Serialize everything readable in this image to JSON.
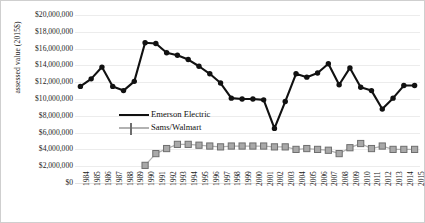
{
  "chart_data": {
    "type": "line",
    "title": "",
    "xlabel": "",
    "ylabel": "assessed value (2015$)",
    "ylim": [
      0,
      20000000
    ],
    "ytick_step": 2000000,
    "grid": true,
    "legend_position": "inside-left-center",
    "ytick_labels": [
      "$20,000,000",
      "$18,000,000",
      "$16,000,000",
      "$14,000,000",
      "$12,000,000",
      "$10,000,000",
      "$8,000,000",
      "$6,000,000",
      "$4,000,000",
      "$2,000,000",
      "$0"
    ],
    "ytick_values": [
      20000000,
      18000000,
      16000000,
      14000000,
      12000000,
      10000000,
      8000000,
      6000000,
      4000000,
      2000000,
      0
    ],
    "categories": [
      "1984",
      "1985",
      "1986",
      "1987",
      "1988",
      "1989",
      "1990",
      "1991",
      "1992",
      "1993",
      "1994",
      "1995",
      "1996",
      "1997",
      "1998",
      "1999",
      "2000",
      "2001",
      "2002",
      "2003",
      "2004",
      "2005",
      "2006",
      "2007",
      "2008",
      "2009",
      "2010",
      "2011",
      "2012",
      "2013",
      "2014",
      "2015"
    ],
    "series": [
      {
        "name": "Emerson Electric",
        "color": "#111111",
        "marker": "circle",
        "values": [
          11500000,
          12400000,
          13800000,
          11500000,
          11000000,
          12100000,
          16700000,
          16600000,
          15500000,
          15200000,
          14700000,
          13900000,
          13000000,
          11900000,
          10100000,
          10000000,
          10000000,
          9900000,
          6500000,
          9700000,
          13000000,
          12600000,
          13100000,
          14200000,
          11700000,
          13700000,
          11400000,
          11000000,
          8800000,
          10100000,
          11600000,
          11600000
        ]
      },
      {
        "name": "Sams/Walmart",
        "color": "#a8a8a8",
        "marker": "square",
        "values": [
          null,
          null,
          null,
          null,
          null,
          null,
          2100000,
          3500000,
          4100000,
          4600000,
          4600000,
          4500000,
          4400000,
          4300000,
          4400000,
          4400000,
          4400000,
          4400000,
          4300000,
          4300000,
          4000000,
          4100000,
          4000000,
          3900000,
          3500000,
          4200000,
          4700000,
          4100000,
          4400000,
          4000000,
          4000000,
          4000000
        ]
      }
    ]
  },
  "legend": {
    "items": [
      {
        "label": "Emerson Electric",
        "marker": "circle-marker",
        "color": "#111111"
      },
      {
        "label": "Sams/Walmart",
        "marker": "square-marker",
        "color": "#a8a8a8"
      }
    ]
  }
}
